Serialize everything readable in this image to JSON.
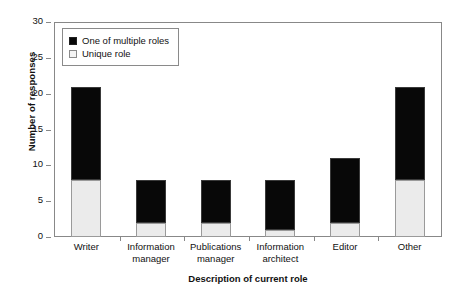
{
  "chart_data": {
    "type": "bar",
    "subtype": "stacked-bar",
    "title": "",
    "xlabel": "Description of current role",
    "ylabel": "Number of responses",
    "categories": [
      "Writer",
      "Information manager",
      "Publications manager",
      "Information architect",
      "Editor",
      "Other"
    ],
    "category_lines": [
      [
        "Writer"
      ],
      [
        "Information",
        "manager"
      ],
      [
        "Publications",
        "manager"
      ],
      [
        "Information",
        "architect"
      ],
      [
        "Editor"
      ],
      [
        "Other"
      ]
    ],
    "series": [
      {
        "name": "Unique role",
        "values": [
          8,
          2,
          2,
          1,
          2,
          8
        ],
        "color": "#ebebeb"
      },
      {
        "name": "One of multiple roles",
        "values": [
          13,
          6,
          6,
          7,
          9,
          13
        ],
        "color": "#080808"
      }
    ],
    "totals": [
      21,
      8,
      8,
      8,
      11,
      21
    ],
    "ylim": [
      0,
      30
    ],
    "yticks": [
      0,
      5,
      10,
      15,
      20,
      25,
      30
    ],
    "ytick_labels": [
      "0",
      "5",
      "10",
      "15",
      "20",
      "25",
      "30"
    ],
    "grid": false,
    "legend": {
      "position": "upper-left-inside",
      "entries": [
        {
          "label": "One of multiple roles",
          "swatch": "filled-black-square"
        },
        {
          "label": "Unique role",
          "swatch": "outlined-white-square"
        }
      ]
    }
  }
}
